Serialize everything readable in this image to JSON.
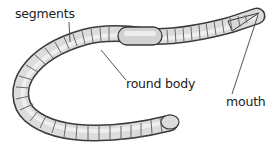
{
  "diagram": {
    "labels": [
      {
        "id": "segments",
        "text": "segments"
      },
      {
        "id": "round_body",
        "text": "round body"
      },
      {
        "id": "mouth",
        "text": "mouth"
      }
    ],
    "colors": {
      "body_fill": "#e2e2e2",
      "body_outline": "#3a3a3a",
      "segment_line": "#6a6a6a",
      "clitellum_fill": "#d6d6d6",
      "leader_line": "#444444",
      "text": "#222222",
      "background": "#ffffff"
    }
  }
}
